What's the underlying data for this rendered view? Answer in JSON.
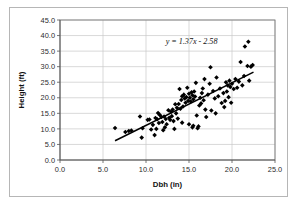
{
  "chart_data": {
    "type": "scatter",
    "title": "",
    "xlabel": "Dbh (in)",
    "ylabel": "Height (ft)",
    "xlim": [
      0.0,
      25.0
    ],
    "ylim": [
      0.0,
      45.0
    ],
    "xticks": [
      "0.0",
      "5.0",
      "10.0",
      "15.0",
      "20.0",
      "25.0"
    ],
    "yticks": [
      "0.0",
      "5.0",
      "10.0",
      "15.0",
      "20.0",
      "25.0",
      "30.0",
      "35.0",
      "40.0",
      "45.0"
    ],
    "xtick_values": [
      0,
      5,
      10,
      15,
      20,
      25
    ],
    "ytick_values": [
      0,
      5,
      10,
      15,
      20,
      25,
      30,
      35,
      40,
      45
    ],
    "grid": true,
    "legend": "none",
    "marker": "diamond",
    "marker_color": "#000000",
    "annotations": [
      {
        "text": "y = 1.37x - 2.58",
        "x": 15.3,
        "y": 37.2,
        "name": "trendline-equation"
      }
    ],
    "trendline": {
      "slope": 1.37,
      "intercept": -2.58,
      "x_start": 6.4,
      "x_end": 22.5,
      "color": "#000000"
    },
    "points": [
      [
        6.4,
        10.3
      ],
      [
        7.6,
        9.0
      ],
      [
        8.0,
        9.3
      ],
      [
        8.3,
        9.5
      ],
      [
        9.3,
        14.0
      ],
      [
        9.5,
        7.2
      ],
      [
        9.6,
        10.2
      ],
      [
        10.2,
        12.9
      ],
      [
        10.4,
        13.0
      ],
      [
        10.8,
        11.3
      ],
      [
        11.0,
        8.0
      ],
      [
        11.1,
        13.5
      ],
      [
        11.3,
        13.1
      ],
      [
        11.4,
        15.1
      ],
      [
        11.5,
        11.9
      ],
      [
        11.6,
        14.5
      ],
      [
        11.8,
        13.8
      ],
      [
        11.9,
        12.2
      ],
      [
        12.0,
        9.6
      ],
      [
        12.1,
        14.0
      ],
      [
        12.3,
        13.2
      ],
      [
        12.4,
        11.5
      ],
      [
        12.6,
        16.0
      ],
      [
        12.7,
        13.6
      ],
      [
        12.8,
        12.9
      ],
      [
        12.9,
        15.5
      ],
      [
        13.0,
        14.1
      ],
      [
        13.1,
        16.2
      ],
      [
        13.2,
        12.5
      ],
      [
        13.4,
        17.9
      ],
      [
        13.5,
        15.0
      ],
      [
        13.6,
        16.8
      ],
      [
        13.7,
        13.3
      ],
      [
        13.8,
        18.0
      ],
      [
        13.9,
        22.8
      ],
      [
        14.0,
        16.5
      ],
      [
        14.1,
        19.3
      ],
      [
        14.2,
        20.5
      ],
      [
        14.3,
        17.2
      ],
      [
        14.4,
        21.0
      ],
      [
        14.5,
        19.8
      ],
      [
        14.6,
        18.4
      ],
      [
        14.7,
        20.2
      ],
      [
        14.8,
        23.2
      ],
      [
        14.9,
        19.0
      ],
      [
        15.0,
        21.3
      ],
      [
        15.1,
        20.0
      ],
      [
        15.2,
        18.8
      ],
      [
        15.3,
        21.8
      ],
      [
        15.4,
        20.8
      ],
      [
        15.5,
        19.5
      ],
      [
        15.6,
        22.0
      ],
      [
        15.7,
        20.4
      ],
      [
        15.8,
        24.8
      ],
      [
        15.9,
        14.3
      ],
      [
        16.0,
        10.2
      ],
      [
        16.1,
        10.8
      ],
      [
        16.2,
        17.5
      ],
      [
        16.3,
        20.0
      ],
      [
        16.4,
        18.2
      ],
      [
        16.5,
        21.5
      ],
      [
        16.6,
        23.0
      ],
      [
        16.7,
        19.2
      ],
      [
        16.8,
        26.0
      ],
      [
        16.9,
        16.2
      ],
      [
        17.0,
        13.8
      ],
      [
        17.2,
        21.0
      ],
      [
        17.4,
        24.5
      ],
      [
        17.5,
        29.8
      ],
      [
        17.6,
        15.9
      ],
      [
        17.8,
        22.2
      ],
      [
        18.0,
        19.8
      ],
      [
        18.2,
        26.5
      ],
      [
        18.4,
        20.5
      ],
      [
        18.6,
        23.0
      ],
      [
        18.8,
        18.3
      ],
      [
        19.0,
        21.5
      ],
      [
        19.2,
        19.0
      ],
      [
        19.3,
        25.0
      ],
      [
        19.4,
        22.0
      ],
      [
        19.5,
        24.0
      ],
      [
        19.6,
        20.2
      ],
      [
        19.7,
        25.5
      ],
      [
        19.8,
        23.5
      ],
      [
        19.9,
        18.4
      ],
      [
        20.0,
        24.5
      ],
      [
        20.2,
        22.8
      ],
      [
        20.4,
        26.0
      ],
      [
        20.6,
        23.2
      ],
      [
        20.8,
        25.2
      ],
      [
        21.0,
        31.5
      ],
      [
        21.2,
        24.0
      ],
      [
        21.4,
        27.0
      ],
      [
        21.5,
        36.5
      ],
      [
        21.8,
        30.2
      ],
      [
        21.9,
        38.0
      ],
      [
        22.0,
        25.5
      ],
      [
        22.2,
        30.0
      ],
      [
        22.4,
        30.5
      ],
      [
        13.3,
        10.0
      ],
      [
        14.2,
        12.0
      ],
      [
        15.0,
        11.5
      ],
      [
        15.4,
        10.5
      ],
      [
        15.5,
        11.0
      ],
      [
        12.2,
        10.5
      ],
      [
        11.2,
        10.0
      ],
      [
        10.6,
        9.8
      ],
      [
        18.1,
        15.0
      ],
      [
        19.1,
        17.0
      ]
    ]
  },
  "axes": {
    "x_title": "Dbh (in)",
    "y_title": "Height (ft)"
  }
}
